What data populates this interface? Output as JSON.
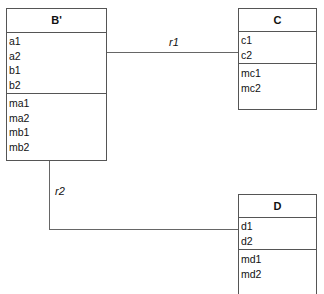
{
  "classes": {
    "b": {
      "name": "B'",
      "attributes": [
        "a1",
        "a2",
        "b1",
        "b2"
      ],
      "methods": [
        "ma1",
        "ma2",
        "mb1",
        "mb2"
      ]
    },
    "c": {
      "name": "C",
      "attributes": [
        "c1",
        "c2"
      ],
      "methods": [
        "mc1",
        "mc2"
      ]
    },
    "d": {
      "name": "D",
      "attributes": [
        "d1",
        "d2"
      ],
      "methods": [
        "md1",
        "md2"
      ]
    }
  },
  "relations": [
    {
      "label": "r1",
      "from": "B'",
      "to": "C"
    },
    {
      "label": "r2",
      "from": "B'",
      "to": "D"
    }
  ]
}
